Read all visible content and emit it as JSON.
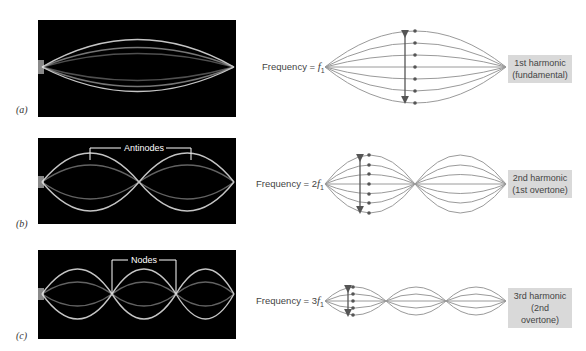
{
  "panels": [
    {
      "id": "a",
      "label": "(a)",
      "photo_annotation": "",
      "frequency_prefix": "Frequency = ",
      "frequency_multiplier": "",
      "frequency_symbol": "f",
      "frequency_subscript": "1",
      "harmonic_line1": "1st harmonic",
      "harmonic_line2": "(fundamental)",
      "loops": 1
    },
    {
      "id": "b",
      "label": "(b)",
      "photo_annotation": "Antinodes",
      "frequency_prefix": "Frequency = ",
      "frequency_multiplier": "2",
      "frequency_symbol": "f",
      "frequency_subscript": "1",
      "harmonic_line1": "2nd harmonic",
      "harmonic_line2": "(1st overtone)",
      "loops": 2
    },
    {
      "id": "c",
      "label": "(c)",
      "photo_annotation": "Nodes",
      "frequency_prefix": "Frequency = ",
      "frequency_multiplier": "3",
      "frequency_symbol": "f",
      "frequency_subscript": "1",
      "harmonic_line1": "3rd harmonic",
      "harmonic_line2": "(2nd overtone)",
      "loops": 3
    }
  ],
  "colors": {
    "photo_bg": "#000000",
    "string_glow": "#e8e8e8",
    "diagram_line": "#9a9a9a",
    "dot": "#555555",
    "arrow": "#555555",
    "label_box": "#d9d9d9"
  }
}
